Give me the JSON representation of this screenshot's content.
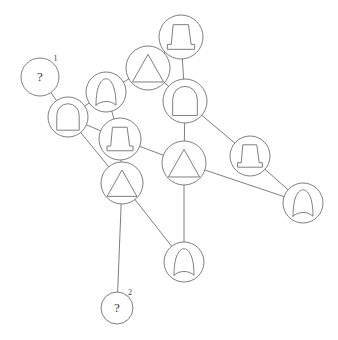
{
  "diagram": {
    "width": 338,
    "height": 340,
    "background_color": "#ffffff",
    "stroke_color": "#6f6f6f",
    "text_color": "#3a3a3a",
    "unknown_marker": "?",
    "nodes": [
      {
        "id": "n1",
        "name": "node-question-1",
        "glyph": "question-mark",
        "label": "?",
        "sup": "1",
        "cx": 40,
        "cy": 77,
        "r": 19
      },
      {
        "id": "n2",
        "name": "node-arch-left",
        "glyph": "arch",
        "label": "",
        "sup": "",
        "cx": 68,
        "cy": 117,
        "r": 20
      },
      {
        "id": "n3",
        "name": "node-bullet-upper",
        "glyph": "bullet",
        "label": "",
        "sup": "",
        "cx": 106,
        "cy": 92,
        "r": 20
      },
      {
        "id": "n4",
        "name": "node-triangle-top",
        "glyph": "triangle",
        "label": "",
        "sup": "",
        "cx": 148,
        "cy": 68,
        "r": 22
      },
      {
        "id": "n5",
        "name": "node-bell-top",
        "glyph": "bell",
        "label": "",
        "sup": "",
        "cx": 181,
        "cy": 37,
        "r": 22
      },
      {
        "id": "n6",
        "name": "node-arch-right",
        "glyph": "arch",
        "label": "",
        "sup": "",
        "cx": 185,
        "cy": 101,
        "r": 22
      },
      {
        "id": "n7",
        "name": "node-bell-middle",
        "glyph": "bell",
        "label": "",
        "sup": "",
        "cx": 120,
        "cy": 139,
        "r": 21
      },
      {
        "id": "n8",
        "name": "node-triangle-left",
        "glyph": "triangle",
        "label": "",
        "sup": "",
        "cx": 122,
        "cy": 183,
        "r": 21
      },
      {
        "id": "n9",
        "name": "node-triangle-center",
        "glyph": "triangle",
        "label": "",
        "sup": "",
        "cx": 184,
        "cy": 163,
        "r": 22
      },
      {
        "id": "n10",
        "name": "node-bell-right",
        "glyph": "bell",
        "label": "",
        "sup": "",
        "cx": 250,
        "cy": 156,
        "r": 20
      },
      {
        "id": "n11",
        "name": "node-bullet-right",
        "glyph": "bullet",
        "label": "",
        "sup": "",
        "cx": 303,
        "cy": 203,
        "r": 20
      },
      {
        "id": "n12",
        "name": "node-bullet-bottom",
        "glyph": "bullet",
        "label": "",
        "sup": "",
        "cx": 184,
        "cy": 262,
        "r": 20
      },
      {
        "id": "n13",
        "name": "node-question-2",
        "glyph": "question-mark",
        "label": "?",
        "sup": "2",
        "cx": 117,
        "cy": 308,
        "r": 16
      }
    ],
    "edges": [
      {
        "name": "edge-n1-n2",
        "from": "n1",
        "to": "n2"
      },
      {
        "name": "edge-n2-n3",
        "from": "n2",
        "to": "n3"
      },
      {
        "name": "edge-n2-n7",
        "from": "n2",
        "to": "n7"
      },
      {
        "name": "edge-n2-n8",
        "from": "n2",
        "to": "n8"
      },
      {
        "name": "edge-n3-n4",
        "from": "n3",
        "to": "n4"
      },
      {
        "name": "edge-n3-n7",
        "from": "n3",
        "to": "n7"
      },
      {
        "name": "edge-n4-n5",
        "from": "n4",
        "to": "n5"
      },
      {
        "name": "edge-n4-n6",
        "from": "n4",
        "to": "n6"
      },
      {
        "name": "edge-n5-n6",
        "from": "n5",
        "to": "n6"
      },
      {
        "name": "edge-n6-n9",
        "from": "n6",
        "to": "n9"
      },
      {
        "name": "edge-n6-n10",
        "from": "n6",
        "to": "n10"
      },
      {
        "name": "edge-n7-n8",
        "from": "n7",
        "to": "n8"
      },
      {
        "name": "edge-n7-n9",
        "from": "n7",
        "to": "n9"
      },
      {
        "name": "edge-n8-n12",
        "from": "n8",
        "to": "n12"
      },
      {
        "name": "edge-n8-n13",
        "from": "n8",
        "to": "n13"
      },
      {
        "name": "edge-n9-n11",
        "from": "n9",
        "to": "n11"
      },
      {
        "name": "edge-n9-n12",
        "from": "n9",
        "to": "n12"
      },
      {
        "name": "edge-n10-n11",
        "from": "n10",
        "to": "n11"
      }
    ]
  }
}
